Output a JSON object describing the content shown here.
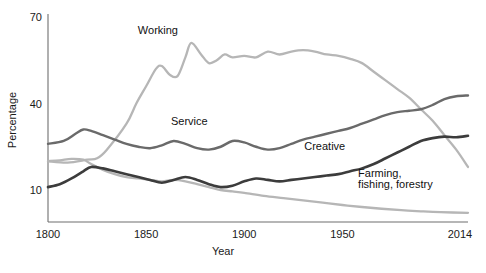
{
  "chart_data": {
    "type": "line",
    "title": "",
    "xlabel": "Year",
    "ylabel": "Percentage",
    "xlim": [
      1800,
      2014
    ],
    "ylim": [
      0,
      70
    ],
    "xticks": [
      1800,
      1850,
      1900,
      1950,
      2014
    ],
    "xtick_labels": [
      "1800",
      "1850",
      "1900",
      "1950",
      "2014"
    ],
    "yticks": [
      10,
      40,
      70
    ],
    "ytick_labels": [
      "10",
      "40",
      "70"
    ],
    "grid": false,
    "legend": "inline-labels",
    "series": [
      {
        "name": "Working",
        "color": "#b6b6b6",
        "label_x": 1890,
        "label_y": 66,
        "x": [
          1800,
          1810,
          1820,
          1825,
          1830,
          1840,
          1845,
          1850,
          1855,
          1858,
          1862,
          1866,
          1870,
          1873,
          1878,
          1882,
          1886,
          1890,
          1894,
          1900,
          1906,
          1912,
          1918,
          1924,
          1930,
          1936,
          1942,
          1948,
          1954,
          1960,
          1966,
          1972,
          1978,
          1984,
          1990,
          1996,
          2002,
          2008,
          2014
        ],
        "values": [
          20,
          19.5,
          20.5,
          21,
          24,
          33,
          40,
          46,
          52,
          53,
          50,
          49.5,
          56,
          61,
          57,
          54,
          55,
          57,
          56,
          56.5,
          56,
          58,
          57,
          58,
          58.5,
          58,
          57,
          56.5,
          55.5,
          54,
          51,
          48,
          45,
          42,
          38,
          34,
          29,
          24,
          18
        ]
      },
      {
        "name": "Service",
        "color": "#6a6a6a",
        "label_x": 1855,
        "label_y": 31,
        "x": [
          1800,
          1808,
          1814,
          1818,
          1822,
          1828,
          1834,
          1840,
          1846,
          1852,
          1858,
          1864,
          1870,
          1876,
          1882,
          1888,
          1894,
          1900,
          1906,
          1912,
          1918,
          1924,
          1930,
          1936,
          1942,
          1948,
          1954,
          1960,
          1966,
          1972,
          1978,
          1984,
          1990,
          1996,
          2002,
          2008,
          2014
        ],
        "values": [
          26,
          27,
          29.5,
          31,
          30.5,
          29,
          27.5,
          26,
          25,
          24.5,
          25.5,
          27,
          26,
          24.5,
          24,
          25,
          27,
          26.5,
          25,
          24,
          24.5,
          26,
          27.5,
          28.5,
          29.5,
          30.5,
          31.5,
          33,
          34.5,
          36,
          37,
          37.5,
          38,
          39.5,
          41.5,
          42.5,
          42.8
        ]
      },
      {
        "name": "Creative",
        "color": "#3c3c3c",
        "label_x": 1930,
        "label_y": 26,
        "x": [
          1800,
          1806,
          1812,
          1818,
          1822,
          1828,
          1834,
          1840,
          1846,
          1852,
          1858,
          1864,
          1870,
          1876,
          1882,
          1888,
          1894,
          1900,
          1906,
          1912,
          1918,
          1924,
          1930,
          1936,
          1942,
          1948,
          1954,
          1960,
          1966,
          1972,
          1978,
          1984,
          1990,
          1996,
          2002,
          2008,
          2014
        ],
        "values": [
          11,
          12,
          14,
          16.5,
          18,
          17.5,
          16.5,
          15.5,
          14.5,
          13.5,
          12.5,
          13.5,
          14.5,
          13.5,
          12,
          11,
          11.5,
          13,
          14,
          13.5,
          13,
          13.5,
          14,
          14.5,
          15,
          15.5,
          16.5,
          17.5,
          19,
          21,
          23,
          25,
          27,
          28,
          28.5,
          28.3,
          28.8
        ]
      },
      {
        "name": "Farming, fishing, forestry",
        "color": "#b6b6b6",
        "label_x": 1975,
        "label_y": 14,
        "x": [
          1800,
          1806,
          1812,
          1818,
          1822,
          1828,
          1834,
          1840,
          1846,
          1852,
          1858,
          1864,
          1870,
          1876,
          1882,
          1888,
          1894,
          1900,
          1910,
          1920,
          1930,
          1940,
          1950,
          1960,
          1970,
          1980,
          1990,
          2000,
          2014
        ],
        "values": [
          20,
          20.3,
          20.8,
          20.5,
          19,
          17,
          15.5,
          14.5,
          14,
          13.5,
          13,
          13.5,
          13,
          12,
          11,
          10,
          9.5,
          9,
          8,
          7.2,
          6.4,
          5.6,
          4.8,
          4.1,
          3.5,
          3,
          2.6,
          2.3,
          2.1
        ]
      }
    ],
    "series_label_lines": {
      "farming_line_1": "Farming,",
      "farming_line_2": "fishing, forestry"
    }
  }
}
